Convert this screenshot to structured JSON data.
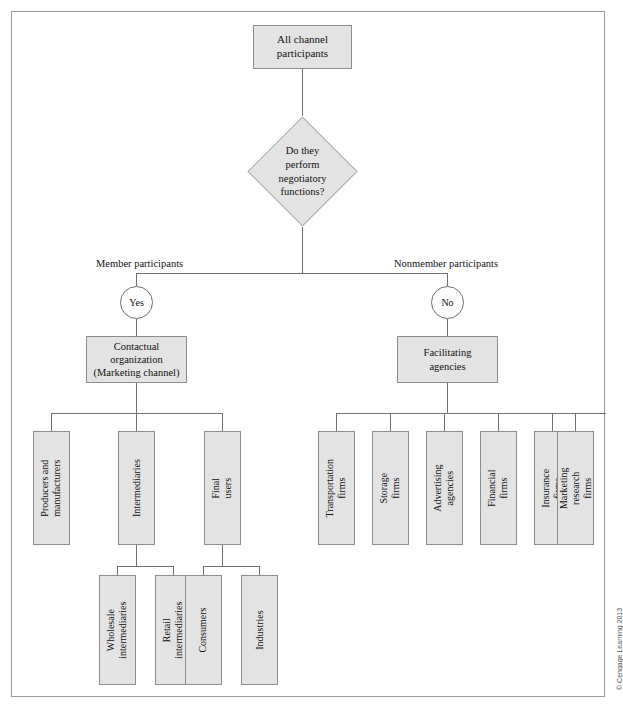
{
  "figure": {
    "root": {
      "label": "All channel\nparticipants"
    },
    "decision": {
      "label": "Do they\nperform\nnegotiatory\nfunctions?"
    },
    "branch_labels": {
      "left": "Member participants",
      "right": "Nonmember participants"
    },
    "gates": {
      "yes": "Yes",
      "no": "No"
    },
    "level2": {
      "left": "Contactual\norganization\n(Marketing channel)",
      "right": "Facilitating\nagencies"
    },
    "member_nodes": [
      {
        "label": "Producers and\nmanufacturers"
      },
      {
        "label": "Intermediaries"
      },
      {
        "label": "Final users"
      }
    ],
    "intermediary_nodes": [
      {
        "label": "Wholesale\nintermediaries"
      },
      {
        "label": "Retail\nintermediaries"
      }
    ],
    "final_user_nodes": [
      {
        "label": "Consumers"
      },
      {
        "label": "Industries"
      }
    ],
    "facilitating_nodes": [
      {
        "label": "Transportation\nfirms"
      },
      {
        "label": "Storage firms"
      },
      {
        "label": "Advertising\nagencies"
      },
      {
        "label": "Financial firms"
      },
      {
        "label": "Insurance firms"
      },
      {
        "label": "Marketing research\nfirms"
      }
    ],
    "credit": "© Cengage Learning 2013",
    "colors": {
      "node_fill": "#e3e3e3",
      "node_border": "#8d8d8d",
      "connector": "#6f6f6f",
      "frame": "#9a9a9a"
    }
  }
}
